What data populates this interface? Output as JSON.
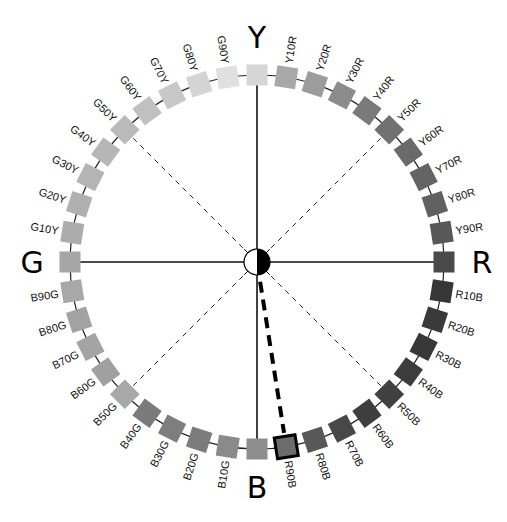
{
  "diagram": {
    "center": {
      "x": 257,
      "y": 262
    },
    "ring_radius": 187,
    "square_size": 21,
    "axes": [
      {
        "letter": "Y",
        "angle": 0
      },
      {
        "letter": "R",
        "angle": 90
      },
      {
        "letter": "B",
        "angle": 180
      },
      {
        "letter": "G",
        "angle": 270
      }
    ],
    "dashed_diagonals": [
      45,
      135,
      225,
      315
    ],
    "highlight": {
      "label": "R90B",
      "index": 19,
      "line_style": "bold-dashed"
    },
    "hues": [
      {
        "label": "Y",
        "color": "#d6d6d6",
        "primary": true
      },
      {
        "label": "Y10R",
        "color": "#a8a8a8"
      },
      {
        "label": "Y20R",
        "color": "#9c9c9c"
      },
      {
        "label": "Y30R",
        "color": "#8c8c8c"
      },
      {
        "label": "Y40R",
        "color": "#7a7a7a"
      },
      {
        "label": "Y50R",
        "color": "#717171"
      },
      {
        "label": "Y60R",
        "color": "#6a6a6a"
      },
      {
        "label": "Y70R",
        "color": "#646464"
      },
      {
        "label": "Y80R",
        "color": "#606060"
      },
      {
        "label": "Y90R",
        "color": "#585858"
      },
      {
        "label": "R",
        "color": "#4a4a4a",
        "primary": true
      },
      {
        "label": "R10B",
        "color": "#363636"
      },
      {
        "label": "R20B",
        "color": "#3a3a3a"
      },
      {
        "label": "R30B",
        "color": "#383838"
      },
      {
        "label": "R40B",
        "color": "#3c3c3c"
      },
      {
        "label": "R50B",
        "color": "#404040"
      },
      {
        "label": "R60B",
        "color": "#3e3e3e"
      },
      {
        "label": "R70B",
        "color": "#484848"
      },
      {
        "label": "R80B",
        "color": "#585858"
      },
      {
        "label": "R90B",
        "color": "#6c6c6c"
      },
      {
        "label": "B",
        "color": "#8e8e8e",
        "primary": true
      },
      {
        "label": "B10G",
        "color": "#8a8a8a"
      },
      {
        "label": "B20G",
        "color": "#7c7c7c"
      },
      {
        "label": "B30G",
        "color": "#7e7e7e"
      },
      {
        "label": "B40G",
        "color": "#7a7a7a"
      },
      {
        "label": "B50G",
        "color": "#a8a8a8"
      },
      {
        "label": "B60G",
        "color": "#a0a0a0"
      },
      {
        "label": "B70G",
        "color": "#a4a4a4"
      },
      {
        "label": "B80G",
        "color": "#a2a2a2"
      },
      {
        "label": "B90G",
        "color": "#a8a8a8"
      },
      {
        "label": "G",
        "color": "#a6a6a6",
        "primary": true
      },
      {
        "label": "G10Y",
        "color": "#acacac"
      },
      {
        "label": "G20Y",
        "color": "#b0b0b0"
      },
      {
        "label": "G30Y",
        "color": "#b4b4b4"
      },
      {
        "label": "G40Y",
        "color": "#b6b6b6"
      },
      {
        "label": "G50Y",
        "color": "#bababa"
      },
      {
        "label": "G60Y",
        "color": "#c0c0c0"
      },
      {
        "label": "G70Y",
        "color": "#c8c8c8"
      },
      {
        "label": "G80Y",
        "color": "#d4d4d4"
      },
      {
        "label": "G90Y",
        "color": "#e0e0e0"
      }
    ]
  }
}
